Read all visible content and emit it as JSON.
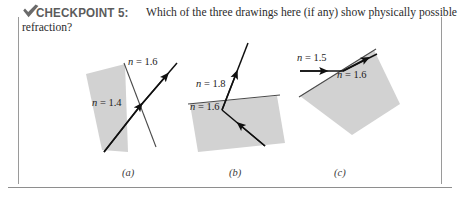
{
  "header": {
    "icon": "checkmark-icon",
    "title": "CHECKPOINT 5:",
    "question_line1": "Which of the three drawings here (if any) show physically possible",
    "question_line2": "refraction?"
  },
  "figure": {
    "fill_color": "#d2d2d2",
    "stroke_color": "#5a5a5a",
    "ray_color": "#101010",
    "panels": [
      {
        "id": "a",
        "caption": "(a)",
        "labels": [
          {
            "name": "index-label-outside",
            "text": "n = 1.6",
            "x": 128,
            "y": 62
          },
          {
            "name": "index-label-inside",
            "text": "n = 1.4",
            "x": 92,
            "y": 103
          }
        ]
      },
      {
        "id": "b",
        "caption": "(b)",
        "labels": [
          {
            "name": "index-label-outside",
            "text": "n = 1.8",
            "x": 196,
            "y": 84
          },
          {
            "name": "index-label-inside",
            "text": "n = 1.6",
            "x": 190,
            "y": 107
          }
        ]
      },
      {
        "id": "c",
        "caption": "(c)",
        "labels": [
          {
            "name": "index-label-outside",
            "text": "n = 1.5",
            "x": 297,
            "y": 58
          },
          {
            "name": "index-label-inside",
            "text": "n = 1.6",
            "x": 337,
            "y": 75
          }
        ]
      }
    ],
    "captions": [
      {
        "text": "(a)",
        "x": 122,
        "y": 169
      },
      {
        "text": "(b)",
        "x": 229,
        "y": 169
      },
      {
        "text": "(c)",
        "x": 334,
        "y": 169
      }
    ]
  }
}
